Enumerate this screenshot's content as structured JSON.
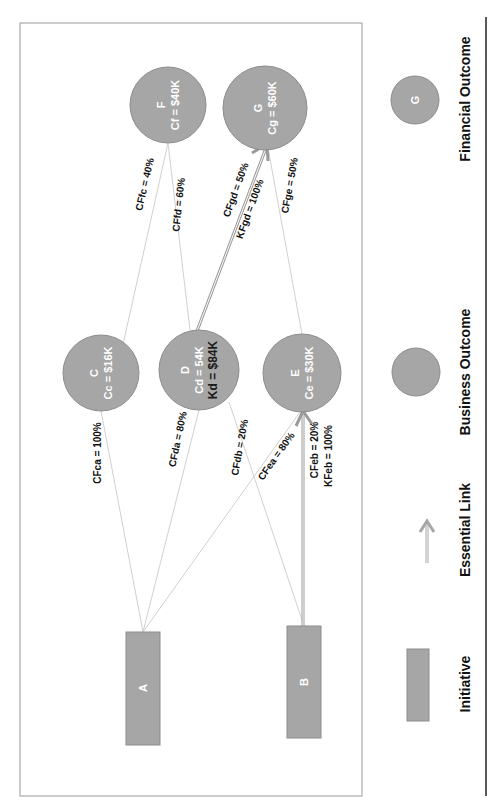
{
  "diagram": {
    "colors": {
      "node_fill": "#a6a6a6",
      "node_stroke": "#8c8c8c",
      "edge": "#d0d0d0",
      "essential_link": "#9a9a9a",
      "frame": "#9a9a9a",
      "divider": "#222222"
    },
    "nodes": {
      "F": {
        "id": "F",
        "cost": "Cf = $40K"
      },
      "G": {
        "id": "G",
        "cost": "Cg = $60K"
      },
      "C": {
        "id": "C",
        "cost": "Cc = $16K"
      },
      "D": {
        "id": "D",
        "cost": "Cd = 54K",
        "k": "Kd = $84K"
      },
      "E": {
        "id": "E",
        "cost": "Ce = $30K"
      },
      "A": {
        "id": "A"
      },
      "B": {
        "id": "B"
      }
    },
    "edges": {
      "cffc": "CFfc = 40%",
      "cffd": "CFfd = 60%",
      "cfgd": "CFgd = 50%",
      "kfgd": "KFgd = 100%",
      "cfge": "CFge = 50%",
      "cfca": "CFca = 100%",
      "cfda": "CFda = 80%",
      "cfdb": "CFdb = 20%",
      "cfea": "CFea = 80%",
      "cfeb": "CFeb = 20%",
      "kfeb": "KFeb = 100%"
    }
  },
  "legend": {
    "financial_outcome": {
      "label": "Financial Outcome",
      "symbol_text": "G"
    },
    "business_outcome": {
      "label": "Business Outcome"
    },
    "essential_link": {
      "label": "Essential Link"
    },
    "initiative": {
      "label": "Initiative"
    }
  }
}
